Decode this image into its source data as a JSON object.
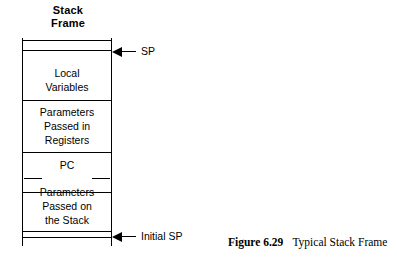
{
  "figure": {
    "title_line1": "Stack",
    "title_line2": "Frame",
    "caption_number": "Figure 6.29",
    "caption_text": "Typical Stack Frame",
    "line_color": "#000000",
    "background_color": "#ffffff"
  },
  "diagram": {
    "type": "memory-layout",
    "regions": [
      {
        "label_line1": "Local",
        "label_line2": "Variables",
        "label_line3": ""
      },
      {
        "label_line1": "Parameters",
        "label_line2": "Passed in",
        "label_line3": "Registers"
      },
      {
        "label_line1": "PC",
        "label_line2": "",
        "label_line3": ""
      },
      {
        "label_line1": "Parameters",
        "label_line2": "Passed on",
        "label_line3": "the Stack"
      }
    ],
    "pointers": [
      {
        "label": "SP",
        "direction": "left"
      },
      {
        "label": "Initial SP",
        "direction": "left"
      }
    ]
  }
}
